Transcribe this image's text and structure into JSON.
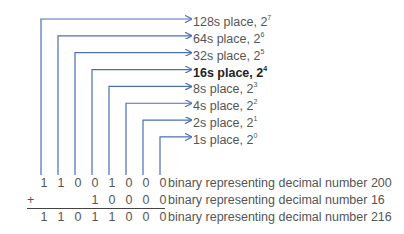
{
  "colors": {
    "connector": "#4a6fb5",
    "text": "#555555",
    "emphasis": "#222222"
  },
  "place_labels": [
    {
      "name": "128s place",
      "base": "2",
      "exponent": "7",
      "bold": false
    },
    {
      "name": "64s place",
      "base": "2",
      "exponent": "6",
      "bold": false
    },
    {
      "name": "32s place",
      "base": "2",
      "exponent": "5",
      "bold": false
    },
    {
      "name": "16s place",
      "base": "2",
      "exponent": "4",
      "bold": true
    },
    {
      "name": "8s place",
      "base": "2",
      "exponent": "3",
      "bold": false
    },
    {
      "name": "4s place",
      "base": "2",
      "exponent": "2",
      "bold": false
    },
    {
      "name": "2s place",
      "base": "2",
      "exponent": "1",
      "bold": false
    },
    {
      "name": "1s place",
      "base": "2",
      "exponent": "0",
      "bold": false
    }
  ],
  "addition": {
    "operator": "+",
    "rows": [
      {
        "digits": [
          "1",
          "1",
          "0",
          "0",
          "1",
          "0",
          "0",
          "0"
        ],
        "description": "binary representing decimal number 200"
      },
      {
        "digits": [
          "",
          "",
          "",
          "1",
          "0",
          "0",
          "0",
          "0"
        ],
        "description": "binary representing decimal number 16"
      },
      {
        "digits": [
          "1",
          "1",
          "0",
          "1",
          "1",
          "0",
          "0",
          "0"
        ],
        "description": "binary representing decimal number 216"
      }
    ]
  }
}
